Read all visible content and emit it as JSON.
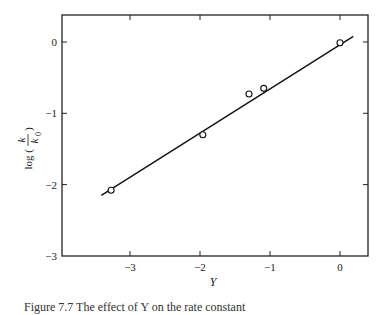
{
  "chart_data": {
    "type": "scatter",
    "title": "",
    "xlabel": "Y",
    "ylabel": "log (k/k0)",
    "ylabel_parts": {
      "prefix": "log",
      "numerator": "k",
      "denominator": "k",
      "denominator_sub": "0"
    },
    "xlim": [
      -3.8,
      0.4
    ],
    "ylim": [
      -3,
      0.4
    ],
    "xticks": [
      -3,
      -2,
      -1,
      0
    ],
    "xtick_labels": [
      "−3",
      "−2",
      "−1",
      "0"
    ],
    "yticks": [
      0,
      -1,
      -2,
      -3
    ],
    "ytick_labels": [
      "0",
      "−1",
      "−2",
      "−3"
    ],
    "grid": false,
    "legend": null,
    "series": [
      {
        "name": "observed",
        "marker": "open-circle",
        "x": [
          -3.27,
          -1.96,
          -1.3,
          -1.09,
          0.0
        ],
        "y": [
          -2.08,
          -1.3,
          -0.73,
          -0.65,
          -0.01
        ]
      },
      {
        "name": "fit-line",
        "marker": "line",
        "x": [
          -3.41,
          0.19
        ],
        "y": [
          -2.15,
          0.08
        ]
      }
    ]
  },
  "caption": "Figure 7.7  The effect of Y on the rate constant"
}
